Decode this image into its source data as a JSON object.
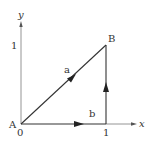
{
  "diagram": {
    "axes": {
      "x_label": "x",
      "y_label": "y",
      "origin_label": "0",
      "x_tick_label": "1",
      "y_tick_label": "1"
    },
    "points": {
      "A": {
        "label": "A",
        "coords": [
          0,
          0
        ]
      },
      "B": {
        "label": "B",
        "coords": [
          1,
          1
        ]
      }
    },
    "vectors": {
      "a": {
        "label": "a",
        "from": "A",
        "to": "B",
        "path": "diagonal"
      },
      "b": {
        "label": "b",
        "from": "A",
        "to": "B",
        "path": "along x-axis to (1,0) then up to (1,1)"
      }
    },
    "colors": {
      "line": "#333333",
      "axis": "#888888",
      "background": "#ffffff"
    }
  }
}
